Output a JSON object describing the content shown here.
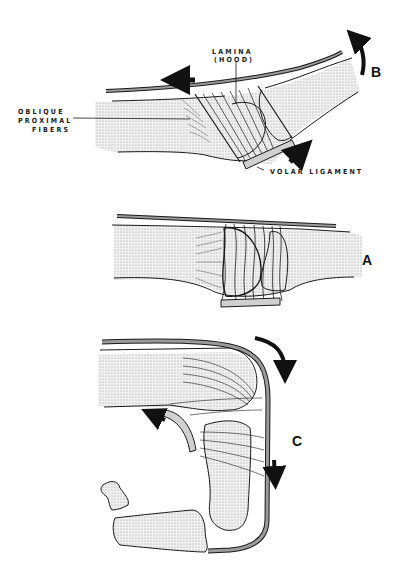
{
  "figure": {
    "panels": [
      {
        "id": "B",
        "letter": "B",
        "description": "extension with lamina (hood) and volar ligament"
      },
      {
        "id": "A",
        "letter": "A",
        "description": "neutral position"
      },
      {
        "id": "C",
        "letter": "C",
        "description": "flexion"
      }
    ],
    "labels": {
      "lamina_line1": "LAMINA",
      "lamina_line2": "(HOOD)",
      "oblique_line1": "OBLIQUE",
      "oblique_line2": "PROXIMAL",
      "oblique_line3": "FIBERS",
      "volar": "VOLAR LIGAMENT"
    },
    "colors": {
      "ink": "#1a1a1a",
      "stipple": "#d9d9d9",
      "tendon": "#9a9a9a"
    }
  }
}
